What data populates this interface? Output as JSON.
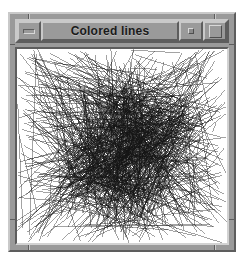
{
  "window": {
    "title": "Colored lines",
    "frame_color": "#9a9a9a",
    "bevel_light": "#c9c9c9",
    "bevel_dark": "#5d5d5d",
    "desktop_background": "#ffffff",
    "titlebar": {
      "minimize_label": "",
      "minimize_icon": "minimize-icon",
      "restore_label": "",
      "restore_icon": "restore-icon",
      "maximize_label": "",
      "maximize_icon": "maximize-icon"
    }
  },
  "canvas": {
    "name": "colored-lines-canvas",
    "background": "#ffffff",
    "line_color": "#141414",
    "line_count": 900,
    "description": "Dense tangle of thin dark straight lines drawn between random points, radiating and crossing across the full drawing area"
  }
}
